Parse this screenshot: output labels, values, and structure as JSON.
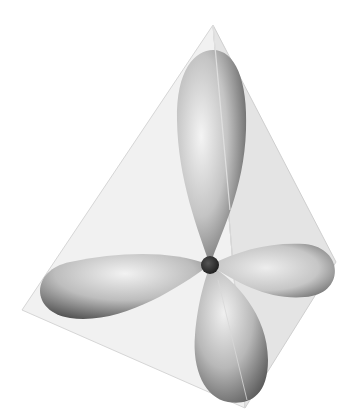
{
  "diagram": {
    "colors": {
      "background": "#ffffff",
      "lobe_light": "#f2f2f2",
      "lobe_mid": "#a8a8a8",
      "lobe_dark": "#4a4a4a",
      "nucleus": "#2e2e2e",
      "tetra_face": "#e6e6e6",
      "tetra_edge": "#cfcfcf"
    },
    "tetrahedron": {
      "vertices": {
        "top": [
          213,
          25
        ],
        "left": [
          22,
          310
        ],
        "right": [
          336,
          262
        ],
        "bottom": [
          245,
          408
        ]
      }
    },
    "nucleus": {
      "cx": 210,
      "cy": 265,
      "r": 9
    },
    "lobes": [
      {
        "name": "up",
        "cx": 210,
        "cy": 140,
        "rx": 36,
        "ry": 115,
        "angle": 2
      },
      {
        "name": "left",
        "cx": 115,
        "cy": 285,
        "rx": 85,
        "ry": 31,
        "angle": -8
      },
      {
        "name": "right",
        "cx": 283,
        "cy": 270,
        "rx": 58,
        "ry": 28,
        "angle": 5
      },
      {
        "name": "down",
        "cx": 227,
        "cy": 335,
        "rx": 38,
        "ry": 70,
        "angle": -12
      }
    ]
  }
}
